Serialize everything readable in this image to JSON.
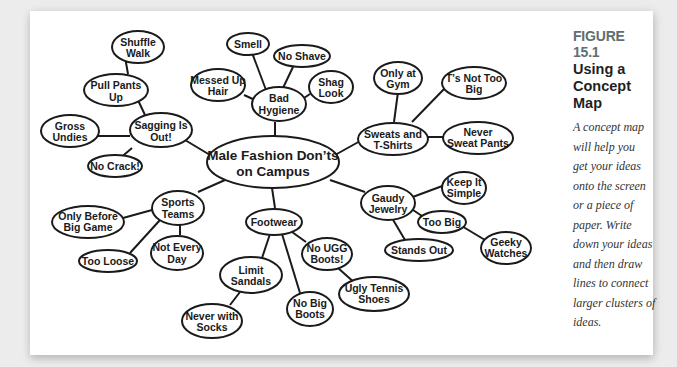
{
  "figure": {
    "number": "FIGURE 15.1",
    "title_line1": "Using a",
    "title_line2": "Concept Map",
    "description_lines": [
      "A concept map",
      "will help you",
      "get your ideas",
      "onto the screen",
      "or a piece of",
      "paper. Write",
      "down your ideas",
      "and then draw",
      "lines to connect",
      "larger clusters of",
      "ideas."
    ],
    "accent_color": "#5f6e70"
  },
  "concept_map": {
    "center": {
      "id": "center",
      "lines": [
        "Male Fashion Don’ts",
        "on Campus"
      ]
    },
    "nodes": [
      {
        "id": "sagging",
        "lines": [
          "Sagging Is",
          "Out!"
        ],
        "parent": "center"
      },
      {
        "id": "pull-pants",
        "lines": [
          "Pull Pants",
          "Up"
        ],
        "parent": "sagging"
      },
      {
        "id": "shuffle",
        "lines": [
          "Shuffle",
          "Walk"
        ],
        "parent": "pull-pants"
      },
      {
        "id": "gross",
        "lines": [
          "Gross",
          "Undies"
        ],
        "parent": "sagging"
      },
      {
        "id": "no-crack",
        "lines": [
          "No Crack!"
        ],
        "parent": "sagging"
      },
      {
        "id": "hygiene",
        "lines": [
          "Bad",
          "Hygiene"
        ],
        "parent": "center"
      },
      {
        "id": "smell",
        "lines": [
          "Smell"
        ],
        "parent": "hygiene"
      },
      {
        "id": "no-shave",
        "lines": [
          "No Shave"
        ],
        "parent": "hygiene"
      },
      {
        "id": "messed",
        "lines": [
          "Messed Up",
          "Hair"
        ],
        "parent": "hygiene"
      },
      {
        "id": "shag",
        "lines": [
          "Shag",
          "Look"
        ],
        "parent": "hygiene"
      },
      {
        "id": "sweats",
        "lines": [
          "Sweats and",
          "T-Shirts"
        ],
        "parent": "center"
      },
      {
        "id": "gym",
        "lines": [
          "Only at",
          "Gym"
        ],
        "parent": "sweats"
      },
      {
        "id": "ts-big",
        "lines": [
          "T’s Not Too",
          "Big"
        ],
        "parent": "sweats"
      },
      {
        "id": "never-sweat",
        "lines": [
          "Never",
          "Sweat Pants"
        ],
        "parent": "sweats"
      },
      {
        "id": "jewelry",
        "lines": [
          "Gaudy",
          "Jewelry"
        ],
        "parent": "center"
      },
      {
        "id": "simple",
        "lines": [
          "Keep It",
          "Simple"
        ],
        "parent": "jewelry"
      },
      {
        "id": "too-big",
        "lines": [
          "Too Big"
        ],
        "parent": "jewelry"
      },
      {
        "id": "geeky",
        "lines": [
          "Geeky",
          "Watches"
        ],
        "parent": "too-big"
      },
      {
        "id": "stands-out",
        "lines": [
          "Stands Out"
        ],
        "parent": "jewelry"
      },
      {
        "id": "sports",
        "lines": [
          "Sports",
          "Teams"
        ],
        "parent": "center"
      },
      {
        "id": "big-game",
        "lines": [
          "Only Before",
          "Big Game"
        ],
        "parent": "sports"
      },
      {
        "id": "too-loose",
        "lines": [
          "Too Loose"
        ],
        "parent": "sports"
      },
      {
        "id": "not-every",
        "lines": [
          "Not Every",
          "Day"
        ],
        "parent": "sports"
      },
      {
        "id": "footwear",
        "lines": [
          "Footwear"
        ],
        "parent": "center"
      },
      {
        "id": "sandals",
        "lines": [
          "Limit",
          "Sandals"
        ],
        "parent": "footwear"
      },
      {
        "id": "socks",
        "lines": [
          "Never with",
          "Socks"
        ],
        "parent": "sandals"
      },
      {
        "id": "big-boots",
        "lines": [
          "No Big",
          "Boots"
        ],
        "parent": "footwear"
      },
      {
        "id": "ugg",
        "lines": [
          "No UGG",
          "Boots!"
        ],
        "parent": "footwear"
      },
      {
        "id": "tennis",
        "lines": [
          "Ugly Tennis",
          "Shoes"
        ],
        "parent": "ugg"
      }
    ]
  }
}
